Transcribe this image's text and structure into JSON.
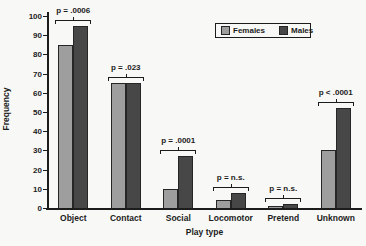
{
  "chart_data": {
    "type": "bar",
    "title": "",
    "xlabel": "Play type",
    "ylabel": "Frequency",
    "ylim": [
      0,
      100
    ],
    "ytick_step": 10,
    "grid": false,
    "categories": [
      "Object",
      "Contact",
      "Social",
      "Locomotor",
      "Pretend",
      "Unknown"
    ],
    "series": [
      {
        "name": "Females",
        "color": "#9e9e9e",
        "values": [
          85,
          65,
          10,
          4,
          1,
          30
        ]
      },
      {
        "name": "Males",
        "color": "#474747",
        "values": [
          95,
          65,
          27,
          8,
          2,
          52
        ]
      }
    ],
    "significance_labels": [
      "p = .0006",
      "p = .023",
      "p = .0001",
      "p = n.s.",
      "p = n.s.",
      "p < .0001"
    ],
    "legend": {
      "position": "top-center-right",
      "items": [
        "Females",
        "Males"
      ]
    },
    "colors": {
      "axis": "#1c1c1c",
      "background": "#f8f8f6"
    }
  }
}
